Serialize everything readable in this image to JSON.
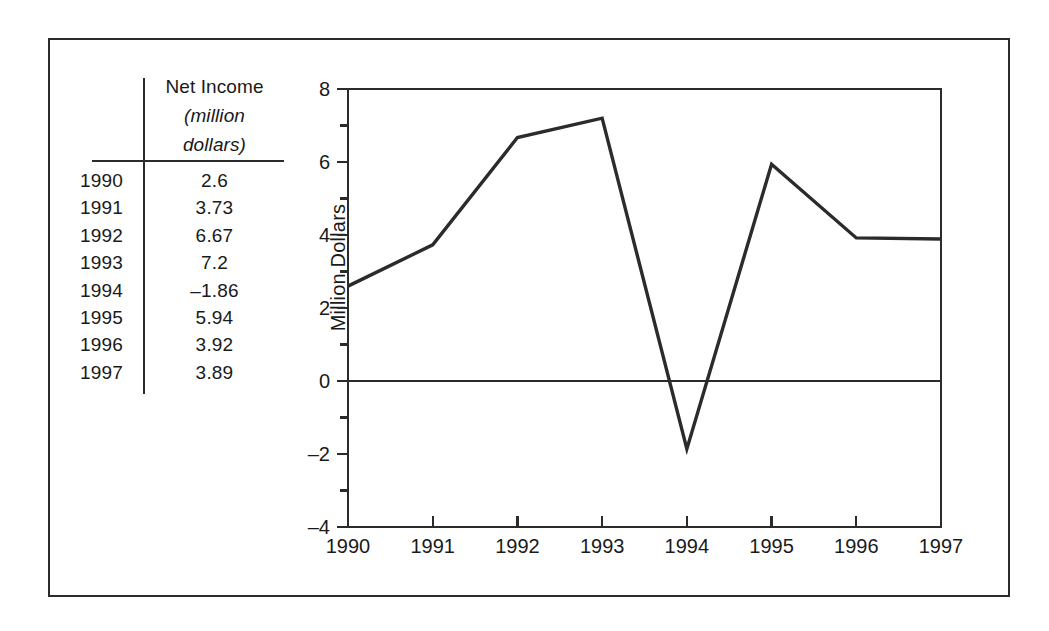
{
  "chart_data": {
    "type": "line",
    "title": "",
    "xlabel": "",
    "ylabel": "Million Dollars",
    "categories": [
      "1990",
      "1991",
      "1992",
      "1993",
      "1994",
      "1995",
      "1996",
      "1997"
    ],
    "x": [
      1990,
      1991,
      1992,
      1993,
      1994,
      1995,
      1996,
      1997
    ],
    "values": [
      2.6,
      3.73,
      6.67,
      7.2,
      -1.86,
      5.94,
      3.92,
      3.89
    ],
    "series": [
      {
        "name": "Net Income",
        "values": [
          2.6,
          3.73,
          6.67,
          7.2,
          -1.86,
          5.94,
          3.92,
          3.89
        ]
      }
    ],
    "xlim": [
      1990,
      1997
    ],
    "ylim": [
      -4,
      8
    ],
    "y_major_ticks": [
      -4,
      -2,
      0,
      2,
      4,
      6,
      8
    ],
    "y_major_tick_labels": [
      "–4",
      "–2",
      "0",
      "2",
      "4",
      "6",
      "8"
    ],
    "y_minor_ticks": [
      -3,
      -1,
      1,
      3,
      5,
      7
    ],
    "x_ticks": [
      1990,
      1991,
      1992,
      1993,
      1994,
      1995,
      1996,
      1997
    ],
    "x_tick_labels": [
      "1990",
      "1991",
      "1992",
      "1993",
      "1994",
      "1995",
      "1996",
      "1997"
    ],
    "grid": false,
    "legend": false,
    "zero_line": true,
    "line_color": "#2b2b2b",
    "axis_color": "#2b2b2b",
    "background_color": "#ffffff"
  },
  "table": {
    "header": {
      "line1": "Net Income",
      "line2": "(million",
      "line3": "dollars)"
    },
    "rows": [
      {
        "year": "1990",
        "value": "2.6"
      },
      {
        "year": "1991",
        "value": "3.73"
      },
      {
        "year": "1992",
        "value": "6.67"
      },
      {
        "year": "1993",
        "value": "7.2"
      },
      {
        "year": "1994",
        "value": "–1.86"
      },
      {
        "year": "1995",
        "value": "5.94"
      },
      {
        "year": "1996",
        "value": "3.92"
      },
      {
        "year": "1997",
        "value": "3.89"
      }
    ]
  }
}
